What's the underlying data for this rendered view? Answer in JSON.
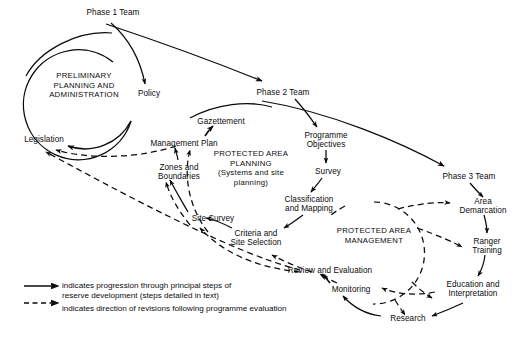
{
  "diagram": {
    "background_color": "#ffffff",
    "line_color": "#0b0b0b",
    "nodes": [
      {
        "id": "phase1team",
        "label": "Phase 1 Team",
        "x": 80,
        "y": 8,
        "w": 66
      },
      {
        "id": "policy",
        "label": "Policy",
        "x": 131,
        "y": 89,
        "w": 36
      },
      {
        "id": "legislation",
        "label": "Legislation",
        "x": 16,
        "y": 135,
        "w": 56
      },
      {
        "id": "phase2team",
        "label": "Phase 2 Team",
        "x": 250,
        "y": 88,
        "w": 66
      },
      {
        "id": "gazettement",
        "label": "Gazettement",
        "x": 190,
        "y": 117,
        "w": 62
      },
      {
        "id": "managementplan",
        "label": "Management Plan",
        "x": 142,
        "y": 139,
        "w": 84
      },
      {
        "id": "zonesboundaries",
        "label": "Zones and\nBoundaries",
        "x": 152,
        "y": 163,
        "w": 54
      },
      {
        "id": "programmeobj",
        "label": "Programme\nObjectives",
        "x": 298,
        "y": 131,
        "w": 56
      },
      {
        "id": "survey",
        "label": "Survey",
        "x": 310,
        "y": 167,
        "w": 36
      },
      {
        "id": "classmapping",
        "label": "Classification\nand Mapping",
        "x": 276,
        "y": 195,
        "w": 66
      },
      {
        "id": "sitesurvey",
        "label": "Site Survey",
        "x": 185,
        "y": 214,
        "w": 56
      },
      {
        "id": "criteriasite",
        "label": "Criteria and\nSite Selection",
        "x": 225,
        "y": 229,
        "w": 62
      },
      {
        "id": "reviewevaluation",
        "label": "Review and Evaluation",
        "x": 283,
        "y": 266,
        "w": 94
      },
      {
        "id": "monitoring",
        "label": "Monitoring",
        "x": 325,
        "y": 285,
        "w": 52
      },
      {
        "id": "research",
        "label": "Research",
        "x": 385,
        "y": 314,
        "w": 46
      },
      {
        "id": "phase3team",
        "label": "Phase 3 Team",
        "x": 436,
        "y": 172,
        "w": 66
      },
      {
        "id": "areademarcation",
        "label": "Area\nDemarcation",
        "x": 452,
        "y": 197,
        "w": 62
      },
      {
        "id": "rangertraining",
        "label": "Ranger\nTraining",
        "x": 464,
        "y": 237,
        "w": 46
      },
      {
        "id": "educationinterp",
        "label": "Education and\nInterpretation",
        "x": 437,
        "y": 280,
        "w": 72
      }
    ],
    "cycles": [
      {
        "id": "preliminary-planning",
        "label": "PRELIMINARY\nPLANNING AND\nADMINISTRATION",
        "x": 36,
        "y": 71,
        "w": 96,
        "cx": 84,
        "cy": 98,
        "r": 55,
        "style": "solid"
      },
      {
        "id": "protected-area-planning",
        "label": "PROTECTED AREA\nPLANNING\n(Systems and site\nplanning)",
        "x": 196,
        "y": 149,
        "w": 110,
        "style": "none"
      },
      {
        "id": "protected-area-management",
        "label": "PROTECTED AREA\nMANAGEMENT",
        "x": 324,
        "y": 226,
        "w": 100,
        "cx": 374,
        "cy": 253,
        "r": 51,
        "style": "dashed"
      }
    ],
    "legend": {
      "solid": {
        "icon": "solid-arrow-icon",
        "text": "indicates progression through principal steps of\nreserve development (steps detailed in text)"
      },
      "dashed": {
        "icon": "dashed-arrow-icon",
        "text": "indicates direction of revisions following programme evaluation"
      }
    }
  }
}
